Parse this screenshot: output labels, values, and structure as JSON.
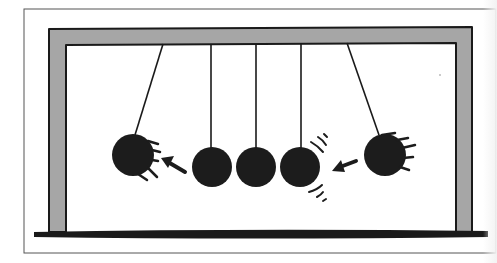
{
  "illustration": {
    "subject": "Newton's cradle",
    "colors": {
      "background": "#ffffff",
      "outline": "#1a1a1a",
      "frame_fill": "#a6a6a6",
      "ball": "#1c1c1c",
      "border": "#555555"
    },
    "border_box": {
      "x": 24,
      "y": 9,
      "w": 472,
      "h": 244
    },
    "frame": {
      "outer": {
        "x": 49,
        "y": 29,
        "w": 423,
        "h": 203
      },
      "thickness": 17,
      "base_y": 232
    },
    "balls": [
      {
        "label": "left-swinging-ball",
        "cx": 133,
        "cy": 155,
        "r": 21,
        "pivot_x": 163,
        "motion": "left"
      },
      {
        "label": "ball-2",
        "cx": 212,
        "cy": 167,
        "r": 20,
        "pivot_x": 211,
        "motion": "rest"
      },
      {
        "label": "ball-3",
        "cx": 256,
        "cy": 167,
        "r": 20,
        "pivot_x": 256,
        "motion": "rest"
      },
      {
        "label": "ball-4",
        "cx": 300,
        "cy": 167,
        "r": 20,
        "pivot_x": 301,
        "motion": "impact"
      },
      {
        "label": "right-swinging-ball",
        "cx": 385,
        "cy": 155,
        "r": 21,
        "pivot_x": 347,
        "motion": "right"
      }
    ],
    "arrows": [
      {
        "label": "arrow-left",
        "from": [
          186,
          171
        ],
        "to": [
          163,
          158
        ]
      },
      {
        "label": "arrow-right",
        "from": [
          356,
          161
        ],
        "to": [
          334,
          170
        ]
      }
    ]
  }
}
